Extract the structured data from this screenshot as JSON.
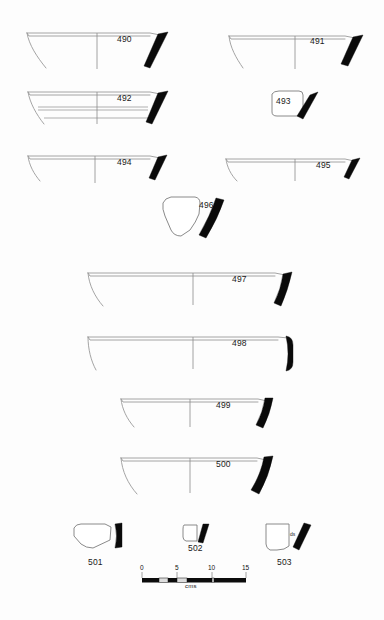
{
  "plate": {
    "title": "Pottery profile plate 490-503",
    "background_color": "#fdfdfd",
    "line_color": "#9a9a9a",
    "rim_color": "#0a0a0a",
    "width": 384,
    "height": 620
  },
  "figures": [
    {
      "id": "490",
      "label": "490",
      "label_x": 117,
      "label_y": 40,
      "type": "open-bowl-profile",
      "row": 1,
      "description": "Wide shallow open bowl rim profile with solid black rim on right"
    },
    {
      "id": "491",
      "label": "491",
      "label_x": 310,
      "label_y": 40,
      "type": "open-bowl-profile",
      "row": 1,
      "description": "Wide shallow open bowl rim profile with solid black rim on right"
    },
    {
      "id": "492",
      "label": "492",
      "label_x": 117,
      "label_y": 99,
      "type": "open-bowl-profile-grooved",
      "row": 2,
      "description": "Shallow bowl profile with two horizontal interior grooves and solid black rim"
    },
    {
      "id": "493",
      "label": "493",
      "label_x": 288,
      "label_y": 102,
      "type": "small-sherd",
      "row": 2,
      "description": "Small angular body sherd with solid black rim segment"
    },
    {
      "id": "494",
      "label": "494",
      "label_x": 117,
      "label_y": 163,
      "type": "open-bowl-profile",
      "row": 3,
      "description": "Shallow open bowl rim profile with solid black rim"
    },
    {
      "id": "495",
      "label": "495",
      "label_x": 318,
      "label_y": 163,
      "type": "open-bowl-profile",
      "row": 3,
      "description": "Shallow open bowl rim profile with solid black rim"
    },
    {
      "id": "496",
      "label": "496",
      "label_x": 199,
      "label_y": 205,
      "type": "small-sherd",
      "row": 4,
      "description": "Irregular body sherd with curved solid black wall section"
    },
    {
      "id": "497",
      "label": "497",
      "label_x": 234,
      "label_y": 277,
      "type": "large-bowl-profile",
      "row": 5,
      "description": "Large wide bowl rim profile with solid black rim"
    },
    {
      "id": "498",
      "label": "498",
      "label_x": 234,
      "label_y": 342,
      "type": "large-bowl-profile",
      "row": 6,
      "description": "Large wide bowl rim profile with thick solid black rim"
    },
    {
      "id": "499",
      "label": "499",
      "label_x": 223,
      "label_y": 404,
      "type": "large-bowl-profile",
      "row": 7,
      "description": "Wide bowl rim profile with solid black rim"
    },
    {
      "id": "500",
      "label": "500",
      "label_x": 223,
      "label_y": 463,
      "type": "large-bowl-profile",
      "row": 8,
      "description": "Wide deep bowl rim profile with thick solid black rim"
    },
    {
      "id": "501",
      "label": "501",
      "label_x": 96,
      "label_y": 563,
      "type": "small-sherd",
      "row": 9,
      "description": "Small pentagonal base sherd with solid black wall"
    },
    {
      "id": "502",
      "label": "502",
      "label_x": 196,
      "label_y": 550,
      "type": "small-sherd",
      "row": 9,
      "description": "Very small rim sherd with solid black rim"
    },
    {
      "id": "503",
      "label": "503",
      "label_x": 285,
      "label_y": 563,
      "type": "small-sherd",
      "row": 9,
      "annotation": "ds",
      "description": "Small rectangular base sherd with solid black wall and small annotation"
    }
  ],
  "scale": {
    "unit_label": "cms",
    "ticks": [
      "0",
      "5",
      "10",
      "15"
    ],
    "tick_values": [
      0,
      5,
      10,
      15
    ],
    "bar_start_x": 142,
    "bar_end_x": 246,
    "bar_y": 578
  }
}
